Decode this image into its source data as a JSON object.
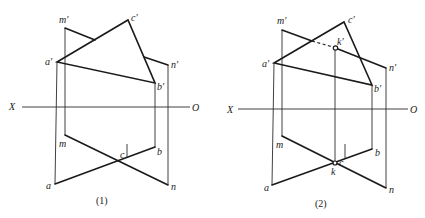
{
  "figures": [
    {
      "caption": "(1)",
      "axis": {
        "left_label": "X",
        "right_label": "O"
      },
      "front_view_labels": {
        "m": "m′",
        "c": "c′",
        "a": "a′",
        "n": "n′",
        "b": "b′"
      },
      "top_view_labels": {
        "m": "m",
        "c": "c",
        "a": "a",
        "n": "n",
        "b": "b"
      }
    },
    {
      "caption": "(2)",
      "axis": {
        "left_label": "X",
        "right_label": "O"
      },
      "front_view_labels": {
        "m": "m′",
        "c": "c′",
        "a": "a′",
        "n": "n′",
        "b": "b′",
        "k": "k′"
      },
      "top_view_labels": {
        "m": "m",
        "c": "c",
        "a": "a",
        "n": "n",
        "b": "b",
        "k": "k"
      }
    }
  ],
  "colors": {
    "line": "#1a1a1a",
    "background": "#ffffff"
  }
}
